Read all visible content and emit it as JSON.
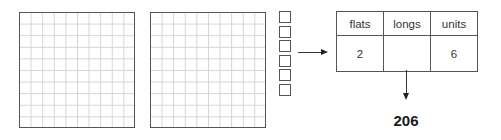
{
  "diagram": {
    "flats": {
      "count": 2,
      "grid_rows": 10,
      "grid_cols": 10
    },
    "longs": {
      "count": 0
    },
    "units": {
      "count": 6
    },
    "table": {
      "headers": [
        "flats",
        "longs",
        "units"
      ],
      "values": [
        "2",
        "",
        "6"
      ]
    },
    "result": "206"
  }
}
